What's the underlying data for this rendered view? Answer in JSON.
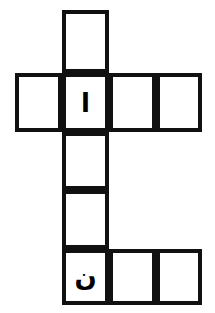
{
  "puzzle": {
    "title": "Arabic crossword grid",
    "description": "Cross-shaped crossword grid of empty white squares with thick black outlines; two squares contain Arabic letters.",
    "script": "Arabic",
    "direction": "rtl",
    "colors": {
      "background": "#ffffff",
      "cell_fill": "#ffffff",
      "border": "#111111",
      "letter": "#000000"
    },
    "geometry": {
      "cell_size": 47,
      "border_width": 4,
      "origin_x": 15,
      "origin_y": 10,
      "columns": 4,
      "rows": 5
    },
    "cells": [
      {
        "id": "cell-r0c1",
        "row": 0,
        "col": 1,
        "x": 62,
        "y": 10,
        "w": 47,
        "h": 63,
        "letter": ""
      },
      {
        "id": "cell-r1c0",
        "row": 1,
        "col": 0,
        "x": 15,
        "y": 73,
        "w": 47,
        "h": 59,
        "letter": ""
      },
      {
        "id": "cell-r1c1",
        "row": 1,
        "col": 1,
        "x": 62,
        "y": 73,
        "w": 47,
        "h": 59,
        "letter": "ا"
      },
      {
        "id": "cell-r1c2",
        "row": 1,
        "col": 2,
        "x": 109,
        "y": 73,
        "w": 47,
        "h": 59,
        "letter": ""
      },
      {
        "id": "cell-r1c3",
        "row": 1,
        "col": 3,
        "x": 156,
        "y": 73,
        "w": 46,
        "h": 59,
        "letter": ""
      },
      {
        "id": "cell-r2c1",
        "row": 2,
        "col": 1,
        "x": 62,
        "y": 132,
        "w": 47,
        "h": 58,
        "letter": ""
      },
      {
        "id": "cell-r3c1",
        "row": 3,
        "col": 1,
        "x": 62,
        "y": 190,
        "w": 47,
        "h": 59,
        "letter": ""
      },
      {
        "id": "cell-r4c1",
        "row": 4,
        "col": 1,
        "x": 62,
        "y": 249,
        "w": 47,
        "h": 56,
        "letter": "ن"
      },
      {
        "id": "cell-r4c2",
        "row": 4,
        "col": 2,
        "x": 109,
        "y": 249,
        "w": 47,
        "h": 56,
        "letter": ""
      },
      {
        "id": "cell-r4c3",
        "row": 4,
        "col": 3,
        "x": 156,
        "y": 249,
        "w": 46,
        "h": 56,
        "letter": ""
      }
    ],
    "filled_letters": [
      {
        "cell": "cell-r1c1",
        "letter": "ا",
        "name": "alef"
      },
      {
        "cell": "cell-r4c1",
        "letter": "ن",
        "name": "noon"
      }
    ]
  }
}
